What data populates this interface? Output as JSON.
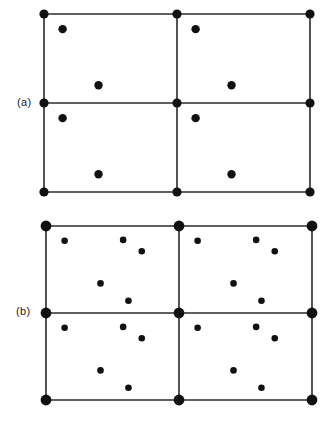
{
  "figure": {
    "background_color": "#ffffff",
    "ink_color": "#111111",
    "line_color": "#2b2b2b",
    "width": 334,
    "height": 433
  },
  "panels": [
    {
      "id": "panel-a",
      "label": "(a)",
      "label_x": 17,
      "label_y": 96,
      "origin_x": 44,
      "origin_y": 14,
      "cell_width": 133,
      "cell_height": 89,
      "columns": 2,
      "rows": 2,
      "line_width": 1.6,
      "vertex_radius": 4.6,
      "interior_radius": 4.2,
      "motif_name": "two-atom-basis",
      "motif": [
        {
          "fx": 0.14,
          "fy": 0.17
        },
        {
          "fx": 0.41,
          "fy": 0.8
        }
      ]
    },
    {
      "id": "panel-b",
      "label": "(b)",
      "label_x": 16,
      "label_y": 305,
      "origin_x": 46,
      "origin_y": 226,
      "cell_width": 133,
      "cell_height": 87,
      "columns": 2,
      "rows": 2,
      "line_width": 1.6,
      "vertex_radius": 5.4,
      "interior_radius": 3.3,
      "motif_name": "five-atom-basis",
      "motif": [
        {
          "fx": 0.14,
          "fy": 0.17
        },
        {
          "fx": 0.58,
          "fy": 0.16
        },
        {
          "fx": 0.72,
          "fy": 0.29
        },
        {
          "fx": 0.41,
          "fy": 0.66
        },
        {
          "fx": 0.62,
          "fy": 0.86
        }
      ]
    }
  ]
}
